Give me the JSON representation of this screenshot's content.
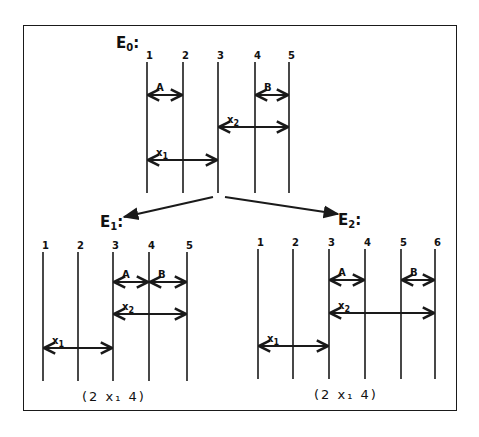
{
  "colors": {
    "ink": "#1a1a1a",
    "background": "#ffffff"
  },
  "frame": {
    "x": 23,
    "y": 25,
    "w": 434,
    "h": 386
  },
  "diagrams": [
    {
      "id": "E0",
      "title": "E",
      "sub": "0",
      "suffix": ":",
      "title_pos": [
        116,
        36
      ],
      "lines_x": [
        147,
        183,
        218,
        255,
        289
      ],
      "top": 62,
      "bottom": 193,
      "labels": [
        "1",
        "2",
        "3",
        "4",
        "5"
      ],
      "segments": [
        {
          "name": "A",
          "label": "A",
          "sub": "",
          "from": 0,
          "to": 1,
          "y": 95
        },
        {
          "name": "B",
          "label": "B",
          "sub": "",
          "from": 3,
          "to": 4,
          "y": 95
        },
        {
          "name": "x2",
          "label": "x",
          "sub": "2",
          "from": 2,
          "to": 4,
          "y": 127
        },
        {
          "name": "x1",
          "label": "x",
          "sub": "1",
          "from": 0,
          "to": 2,
          "y": 160
        }
      ],
      "caption": ""
    },
    {
      "id": "E1",
      "title": "E",
      "sub": "1",
      "suffix": ":",
      "title_pos": [
        100,
        215
      ],
      "lines_x": [
        43,
        78,
        113,
        149,
        187
      ],
      "top": 252,
      "bottom": 381,
      "labels": [
        "1",
        "2",
        "3",
        "4",
        "5"
      ],
      "segments": [
        {
          "name": "A",
          "label": "A",
          "sub": "",
          "from": 2,
          "to": 3,
          "y": 282
        },
        {
          "name": "B",
          "label": "B",
          "sub": "",
          "from": 3,
          "to": 4,
          "y": 282
        },
        {
          "name": "x2",
          "label": "x",
          "sub": "2",
          "from": 2,
          "to": 4,
          "y": 314
        },
        {
          "name": "x1",
          "label": "x",
          "sub": "1",
          "from": 0,
          "to": 2,
          "y": 348
        }
      ],
      "caption": "(2 x₁ 4)",
      "caption_pos": [
        82,
        390
      ]
    },
    {
      "id": "E2",
      "title": "E",
      "sub": "2",
      "suffix": ":",
      "title_pos": [
        338,
        213
      ],
      "lines_x": [
        258,
        293,
        329,
        365,
        401,
        435
      ],
      "top": 249,
      "bottom": 379,
      "labels": [
        "1",
        "2",
        "3",
        "4",
        "5",
        "6"
      ],
      "segments": [
        {
          "name": "A",
          "label": "A",
          "sub": "",
          "from": 2,
          "to": 3,
          "y": 280
        },
        {
          "name": "B",
          "label": "B",
          "sub": "",
          "from": 4,
          "to": 5,
          "y": 280
        },
        {
          "name": "x2",
          "label": "x",
          "sub": "2",
          "from": 2,
          "to": 5,
          "y": 313
        },
        {
          "name": "x1",
          "label": "x",
          "sub": "1",
          "from": 0,
          "to": 2,
          "y": 346
        }
      ],
      "caption": "(2 x₁ 4)",
      "caption_pos": [
        314,
        388
      ]
    }
  ],
  "branches": [
    {
      "name": "branch-to-E1",
      "from": [
        213,
        197
      ],
      "to": [
        124,
        217
      ]
    },
    {
      "name": "branch-to-E2",
      "from": [
        225,
        197
      ],
      "to": [
        338,
        214
      ]
    }
  ]
}
